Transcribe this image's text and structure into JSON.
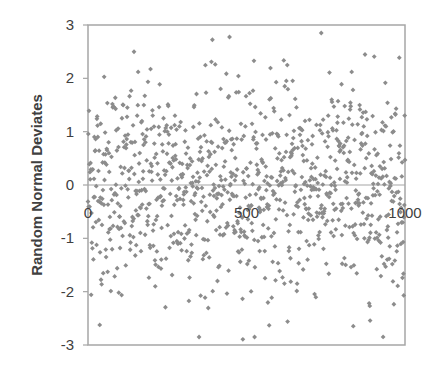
{
  "chart_data": {
    "type": "scatter",
    "title": "",
    "xlabel": "",
    "ylabel": "Random Normal Deviates",
    "x_tick_labels": [
      "0",
      "500",
      "1000"
    ],
    "x_ticks": [
      0,
      500,
      1000
    ],
    "y_tick_labels": [
      "3",
      "2",
      "1",
      "0",
      "-1",
      "-2",
      "-3"
    ],
    "y_ticks": [
      3,
      2,
      1,
      0,
      -1,
      -2,
      -3
    ],
    "xlim": [
      0,
      1000
    ],
    "ylim": [
      -3,
      3
    ],
    "grid": false,
    "legend": null,
    "series": [
      {
        "name": "Random Normal Deviates",
        "n_points": 1000,
        "distribution": "standard normal (mean 0, sd 1), clipped to [-3, 3]",
        "marker": "diamond",
        "color": "#8c8c8c"
      }
    ]
  },
  "colors": {
    "marker": "#8c8c8c",
    "axis": "#a6a6a6",
    "text": "#404040",
    "background": "#ffffff"
  }
}
